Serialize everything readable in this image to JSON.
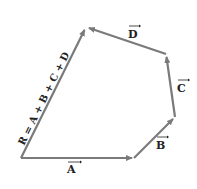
{
  "diagram": {
    "colors": {
      "vector": "#7a7a7a",
      "text": "#222222",
      "background": "#ffffff"
    },
    "points": {
      "origin": [
        21,
        158
      ],
      "a_end": [
        134,
        158
      ],
      "b_end": [
        175,
        117
      ],
      "c_end": [
        166,
        54
      ],
      "d_end": [
        86,
        27
      ]
    },
    "vectors": [
      {
        "name": "A",
        "label": "A",
        "from": "origin",
        "to": "a_end"
      },
      {
        "name": "B",
        "label": "B",
        "from": "a_end",
        "to": "b_end"
      },
      {
        "name": "C",
        "label": "C",
        "from": "b_end",
        "to": "c_end"
      },
      {
        "name": "D",
        "label": "D",
        "from": "c_end",
        "to": "d_end"
      },
      {
        "name": "R",
        "label": "R = A + B + C + D",
        "from": "origin",
        "to": "d_end"
      }
    ],
    "labels": {
      "A": "A",
      "B": "B",
      "C": "C",
      "D": "D",
      "R": "R = A + B + C + D"
    }
  }
}
